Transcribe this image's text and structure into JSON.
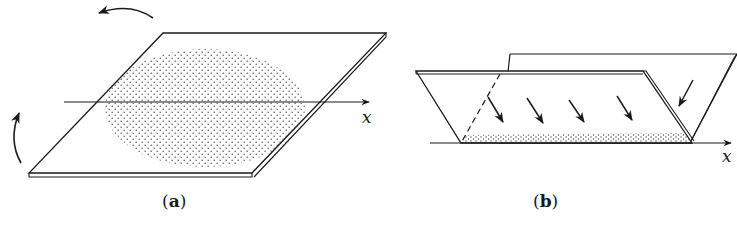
{
  "figure": {
    "panels": [
      {
        "id": "a",
        "label_open": "(",
        "label_letter": "a",
        "label_close": ")",
        "axis_label": "x",
        "description": "Tilted thin plate with elliptical dotted region; curved arrows indicate rotation about the x axis"
      },
      {
        "id": "b",
        "label_open": "(",
        "label_letter": "b",
        "label_close": ")",
        "axis_label": "x",
        "description": "Two plates forming a V-shaped fold; straight arrows show particles settling onto a dotted strip along the x axis"
      }
    ],
    "colors": {
      "ink": "#1a1a1a",
      "background": "#ffffff"
    }
  }
}
